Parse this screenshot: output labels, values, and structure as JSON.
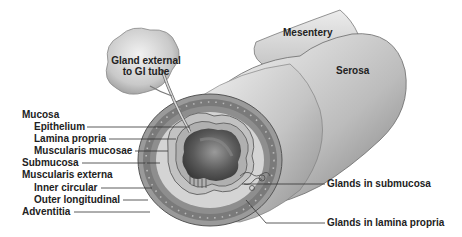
{
  "diagram": {
    "labels": {
      "gland_external": "Gland external\nto GI tube",
      "gland_external_line1": "Gland external",
      "gland_external_line2": "to GI tube",
      "mesentery": "Mesentery",
      "serosa": "Serosa",
      "mucosa": "Mucosa",
      "epithelium": "Epithelium",
      "lamina_propria": "Lamina propria",
      "muscularis_mucosae": "Muscularis mucosae",
      "submucosa": "Submucosa",
      "muscularis_externa": "Muscularis externa",
      "inner_circular": "Inner circular",
      "outer_longitudinal": "Outer longitudinal",
      "adventitia": "Adventitia",
      "glands_submucosa": "Glands in submucosa",
      "glands_lamina_propria": "Glands in lamina propria"
    },
    "colors": {
      "text": "#222222",
      "leader": "#333333",
      "tube_light": "#e6e6e6",
      "tube_mid": "#bdbdbd",
      "tube_dark": "#8a8a8a",
      "muscle_ring": "#6f6f6f",
      "submucosa_fill": "#d6d6d6",
      "lumen_dark": "#4a4a4a"
    }
  }
}
